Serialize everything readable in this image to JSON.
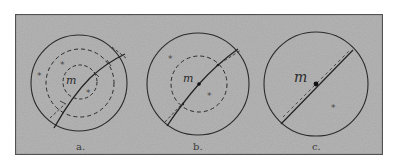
{
  "figure": {
    "background_color": "#b4b4b4",
    "frame_color": "#5a5a5a",
    "stroke_color": "#2b2b2b",
    "panels": [
      {
        "id": "a",
        "label": "a.",
        "mass_label": "m",
        "star_symbol": "*",
        "outer_circle": {
          "cx": 79,
          "cy": 83,
          "r": 48
        },
        "dashed_circles": [
          {
            "cx": 80,
            "cy": 83,
            "r": 34
          },
          {
            "cx": 80,
            "cy": 82,
            "r": 17
          }
        ]
      },
      {
        "id": "b",
        "label": "b.",
        "mass_label": "m",
        "star_symbol": "*",
        "outer_circle": {
          "cx": 198,
          "cy": 84,
          "r": 51
        },
        "dashed_circles": [
          {
            "cx": 199,
            "cy": 84,
            "r": 28
          }
        ]
      },
      {
        "id": "c",
        "label": "c.",
        "mass_label": "m",
        "star_symbol": "*",
        "outer_circle": {
          "cx": 316,
          "cy": 84,
          "r": 52
        },
        "dashed_circles": []
      }
    ]
  }
}
